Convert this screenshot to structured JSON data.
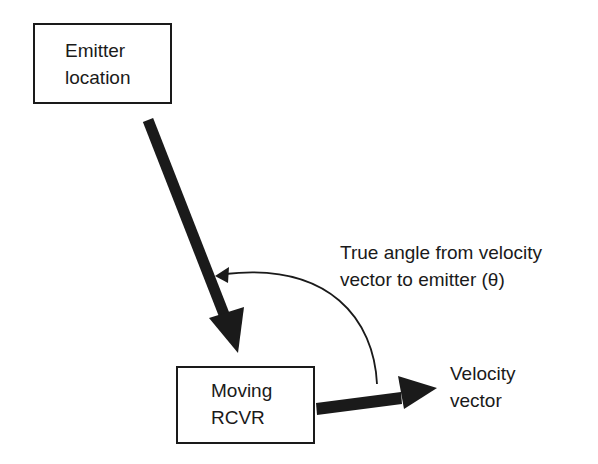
{
  "diagram": {
    "emitter_box": {
      "line1": "Emitter",
      "line2": "location"
    },
    "receiver_box": {
      "line1": "Moving",
      "line2": "RCVR"
    },
    "angle_label": {
      "line1": "True angle from velocity",
      "line2": "vector to emitter (θ)"
    },
    "velocity_label": {
      "line1": "Velocity",
      "line2": "vector"
    },
    "colors": {
      "ink": "#1a1a1a",
      "background": "#ffffff"
    }
  }
}
